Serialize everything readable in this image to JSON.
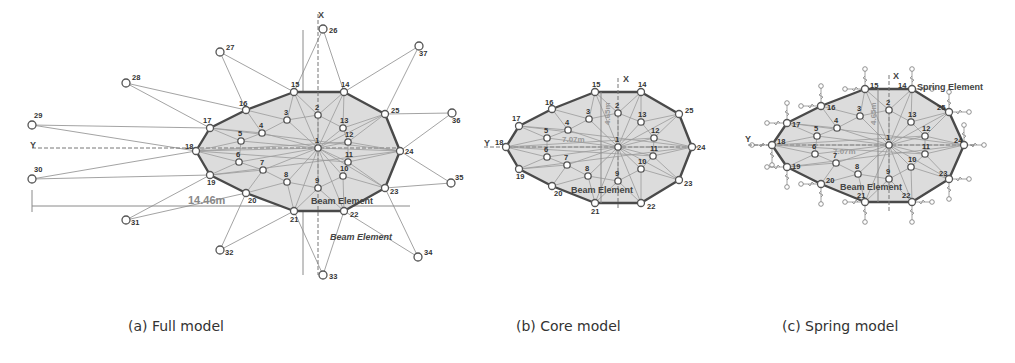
{
  "panels": [
    {
      "id": "a",
      "caption": "(a) Full model",
      "axis_x_label": "X",
      "axis_y_label": "Y",
      "dimension_width": "14.46m",
      "dimension_height": "8.35m",
      "annotations": [
        "Beam Element",
        "Beam Element"
      ],
      "interior_nodes": {
        "1": [
          318,
          148
        ],
        "2": [
          318,
          115
        ],
        "3": [
          287,
          120
        ],
        "4": [
          262,
          133
        ],
        "5": [
          241,
          141
        ],
        "6": [
          239,
          162
        ],
        "7": [
          263,
          170
        ],
        "8": [
          287,
          182
        ],
        "9": [
          318,
          188
        ],
        "10": [
          343,
          176
        ],
        "11": [
          348,
          162
        ],
        "12": [
          348,
          142
        ],
        "13": [
          343,
          128
        ]
      },
      "boundary_nodes": {
        "14": [
          344,
          92
        ],
        "15": [
          294,
          92
        ],
        "16": [
          246,
          110
        ],
        "17": [
          210,
          128
        ],
        "18": [
          196,
          151
        ],
        "19": [
          210,
          175
        ],
        "20": [
          246,
          193
        ],
        "21": [
          294,
          211
        ],
        "22": [
          344,
          211
        ],
        "23": [
          385,
          188
        ],
        "24": [
          400,
          151
        ],
        "25": [
          385,
          114
        ]
      },
      "outer_nodes": {
        "26": [
          323,
          29
        ],
        "27": [
          220,
          52
        ],
        "28": [
          126,
          83
        ],
        "29": [
          32,
          125
        ],
        "30": [
          32,
          179
        ],
        "31": [
          126,
          220
        ],
        "32": [
          220,
          250
        ],
        "33": [
          323,
          275
        ],
        "34": [
          418,
          257
        ],
        "35": [
          451,
          183
        ],
        "36": [
          452,
          113
        ],
        "37": [
          419,
          46
        ]
      }
    },
    {
      "id": "b",
      "caption": "(b) Core model",
      "axis_x_label": "X",
      "axis_y_label": "Y",
      "dimension_width": "7.07m",
      "dimension_height": "4.65m",
      "annotations": [
        "Beam Element"
      ],
      "interior_nodes": {
        "1": [
          618,
          147
        ],
        "2": [
          618,
          113
        ],
        "3": [
          589,
          119
        ],
        "4": [
          568,
          130
        ],
        "5": [
          547,
          138
        ],
        "6": [
          547,
          157
        ],
        "7": [
          567,
          165
        ],
        "8": [
          588,
          176
        ],
        "9": [
          618,
          181
        ],
        "10": [
          641,
          169
        ],
        "11": [
          653,
          156
        ],
        "12": [
          654,
          138
        ],
        "13": [
          641,
          122
        ]
      },
      "boundary_nodes": {
        "14": [
          641,
          92
        ],
        "15": [
          595,
          92
        ],
        "16": [
          552,
          109
        ],
        "17": [
          519,
          126
        ],
        "18": [
          506,
          147
        ],
        "19": [
          519,
          169
        ],
        "20": [
          552,
          186
        ],
        "21": [
          595,
          203
        ],
        "22": [
          641,
          203
        ],
        "23": [
          679,
          180
        ],
        "24": [
          692,
          147
        ],
        "25": [
          679,
          114
        ]
      }
    },
    {
      "id": "c",
      "caption": "(c) Spring model",
      "axis_x_label": "X",
      "axis_y_label": "Y",
      "dimension_width": "7.07m",
      "dimension_height": "4.65m",
      "annotations": [
        "Spring Element",
        "Beam Element"
      ],
      "interior_nodes": {
        "1": [
          889,
          145
        ],
        "2": [
          889,
          110
        ],
        "3": [
          860,
          116
        ],
        "4": [
          837,
          128
        ],
        "5": [
          817,
          136
        ],
        "6": [
          815,
          154
        ],
        "7": [
          836,
          163
        ],
        "8": [
          858,
          174
        ],
        "9": [
          889,
          179
        ],
        "10": [
          911,
          167
        ],
        "11": [
          925,
          154
        ],
        "12": [
          925,
          136
        ],
        "13": [
          911,
          122
        ]
      },
      "boundary_nodes": {
        "14": [
          912,
          89
        ],
        "15": [
          865,
          89
        ],
        "16": [
          821,
          106
        ],
        "17": [
          787,
          123
        ],
        "18": [
          772,
          145
        ],
        "19": [
          787,
          167
        ],
        "20": [
          821,
          184
        ],
        "21": [
          865,
          202
        ],
        "22": [
          912,
          202
        ],
        "23": [
          949,
          179
        ],
        "24": [
          964,
          145
        ],
        "25": [
          949,
          112
        ]
      }
    }
  ]
}
